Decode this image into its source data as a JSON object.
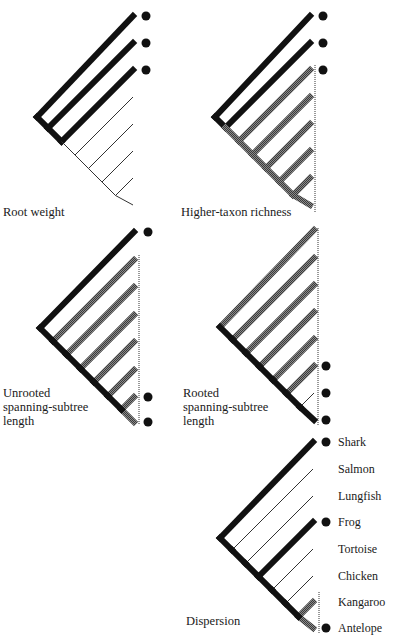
{
  "figure": {
    "title_cut": "Measures of phylogenetic diversity",
    "colors": {
      "black": "#111111",
      "grey": "#555555",
      "thin": "#333333",
      "dot": "#111111"
    }
  },
  "panels": [
    {
      "id": "root-weight",
      "label": [
        "Root weight"
      ],
      "root": [
        37,
        117
      ],
      "tipX": 133,
      "tips": [
        16,
        43,
        70,
        97,
        124,
        151,
        178,
        205
      ],
      "tipStyles": [
        "black",
        "black",
        "black",
        "thin",
        "thin",
        "thin",
        "thin",
        "thin"
      ],
      "dots": [
        0,
        1,
        2
      ],
      "dotX": 146,
      "dotted": null
    },
    {
      "id": "higher-taxon-richness",
      "label": [
        "Higher-taxon richness"
      ],
      "root": [
        215,
        117
      ],
      "tipX": 310,
      "tips": [
        16,
        43,
        70,
        97,
        124,
        151,
        178,
        205
      ],
      "tipStyles": [
        "black",
        "black",
        "grey",
        "grey",
        "grey",
        "grey",
        "grey",
        "grey"
      ],
      "dots": [
        0,
        1,
        2
      ],
      "dotX": 323,
      "dotted": [
        315,
        65,
        212
      ]
    },
    {
      "id": "unrooted-spanning-subtree",
      "label": [
        "Unrooted",
        "spanning-subtree",
        "length"
      ],
      "root": [
        40,
        328
      ],
      "tipX": 134,
      "tips": [
        232,
        260,
        287,
        315,
        342,
        370,
        397,
        422
      ],
      "tipStyles": [
        "black",
        "grey",
        "grey",
        "grey",
        "grey",
        "grey",
        "grey",
        "grey"
      ],
      "dots": [
        0,
        6,
        7
      ],
      "dotX": 148,
      "dotted": [
        139,
        255,
        425
      ]
    },
    {
      "id": "rooted-spanning-subtree",
      "label": [
        "Rooted",
        "spanning-subtree",
        "length"
      ],
      "root": [
        220,
        327
      ],
      "tipX": 314,
      "tips": [
        230,
        258,
        285,
        312,
        339,
        366,
        393,
        420
      ],
      "tipStyles": [
        "grey",
        "grey",
        "grey",
        "grey",
        "grey",
        "grey",
        "thin",
        "black"
      ],
      "dots": [
        5,
        6,
        7
      ],
      "dotX": 326,
      "dotted": [
        318,
        228,
        425
      ]
    },
    {
      "id": "dispersion",
      "label": [
        "Dispersion"
      ],
      "root": [
        220,
        538
      ],
      "tipX": 313,
      "tips": [
        442,
        469,
        496,
        522,
        549,
        576,
        602,
        628
      ],
      "tipStyles": [
        "black",
        "thin",
        "thin",
        "black",
        "thin",
        "thin",
        "grey",
        "grey"
      ],
      "dots": [
        0,
        3,
        7
      ],
      "dotX": 326,
      "dotted": [
        319,
        592,
        634
      ]
    }
  ],
  "taxa": [
    "Shark",
    "Salmon",
    "Lungfish",
    "Frog",
    "Tortoise",
    "Chicken",
    "Kangaroo",
    "Antelope"
  ],
  "labels": {
    "root_weight": "Root weight",
    "higher_taxon": "Higher-taxon richness",
    "unrooted_1": "Unrooted",
    "unrooted_2": "spanning-subtree",
    "unrooted_3": "length",
    "rooted_1": "Rooted",
    "rooted_2": "spanning-subtree",
    "rooted_3": "length",
    "dispersion": "Dispersion"
  }
}
